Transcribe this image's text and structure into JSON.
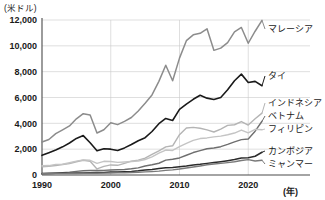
{
  "chart_data": {
    "type": "line",
    "title": "",
    "xlabel": "(年)",
    "ylabel": "(米ドル)",
    "unit_label": "(米ドル)",
    "year_label": "(年)",
    "grid": true,
    "legend_position": "right-inline",
    "xlim": [
      1990,
      2022
    ],
    "ylim": [
      0,
      12000
    ],
    "x_ticks": [
      "1990",
      "2000",
      "2010",
      "2020"
    ],
    "x_tick_values": [
      1990,
      2000,
      2010,
      2020
    ],
    "y_ticks": [
      "0",
      "2,000",
      "4,000",
      "6,000",
      "8,000",
      "10,000",
      "12,000"
    ],
    "y_tick_values": [
      0,
      2000,
      4000,
      6000,
      8000,
      10000,
      12000
    ],
    "x": [
      1990,
      1991,
      1992,
      1993,
      1994,
      1995,
      1996,
      1997,
      1998,
      1999,
      2000,
      2001,
      2002,
      2003,
      2004,
      2005,
      2006,
      2007,
      2008,
      2009,
      2010,
      2011,
      2012,
      2013,
      2014,
      2015,
      2016,
      2017,
      2018,
      2019,
      2020,
      2021,
      2022
    ],
    "series": [
      {
        "name": "マレーシア",
        "color": "#8c8c8c",
        "width": 1.5,
        "values": [
          2550,
          2750,
          3200,
          3500,
          3800,
          4350,
          4750,
          4650,
          3250,
          3500,
          4050,
          3900,
          4150,
          4450,
          4950,
          5550,
          6200,
          7250,
          8500,
          7300,
          9050,
          10400,
          10850,
          10970,
          11320,
          9650,
          9820,
          10250,
          11080,
          11420,
          10200,
          11130,
          11970
        ]
      },
      {
        "name": "タイ",
        "color": "#1a1a1a",
        "width": 1.6,
        "values": [
          1520,
          1720,
          1930,
          2180,
          2480,
          2830,
          3050,
          2500,
          1870,
          2030,
          2000,
          1900,
          2100,
          2360,
          2650,
          2890,
          3370,
          3970,
          4380,
          4220,
          5080,
          5490,
          5860,
          6170,
          5950,
          5840,
          6000,
          6600,
          7300,
          7810,
          7160,
          7250,
          6910
        ]
      },
      {
        "name": "インドネシア",
        "color": "#b4b4b4",
        "width": 1.4,
        "values": [
          640,
          680,
          730,
          810,
          890,
          1030,
          1140,
          1060,
          470,
          670,
          780,
          750,
          900,
          1070,
          1150,
          1300,
          1590,
          1860,
          2180,
          2260,
          3120,
          3640,
          3690,
          3620,
          3490,
          3330,
          3560,
          3840,
          3890,
          4140,
          3870,
          4350,
          4790
        ]
      },
      {
        "name": "ベトナム",
        "color": "#6e6e6e",
        "width": 1.4,
        "values": [
          95,
          140,
          145,
          185,
          225,
          280,
          325,
          350,
          350,
          360,
          390,
          405,
          430,
          480,
          550,
          700,
          790,
          910,
          1150,
          1220,
          1320,
          1530,
          1740,
          1890,
          2030,
          2090,
          2190,
          2370,
          2570,
          2740,
          2790,
          3390,
          4160
        ]
      },
      {
        "name": "フィリピン",
        "color": "#c4c4c4",
        "width": 1.4,
        "values": [
          720,
          730,
          820,
          830,
          950,
          1070,
          1170,
          1140,
          900,
          1060,
          1050,
          980,
          1010,
          1040,
          1080,
          1200,
          1400,
          1690,
          1930,
          1900,
          2200,
          2450,
          2680,
          2820,
          2870,
          2950,
          3010,
          3120,
          3250,
          3480,
          3260,
          3540,
          3500
        ]
      },
      {
        "name": "カンボジア",
        "color": "#2b2b2b",
        "width": 1.5,
        "values": [
          120,
          125,
          130,
          135,
          140,
          150,
          160,
          170,
          185,
          200,
          230,
          240,
          255,
          280,
          320,
          380,
          430,
          500,
          570,
          580,
          640,
          700,
          780,
          830,
          900,
          960,
          1030,
          1110,
          1200,
          1320,
          1340,
          1450,
          1760
        ]
      },
      {
        "name": "ミャンマー",
        "color": "#7a7a7a",
        "width": 1.4,
        "values": [
          100,
          102,
          105,
          110,
          115,
          120,
          125,
          130,
          135,
          145,
          155,
          165,
          180,
          195,
          215,
          240,
          265,
          300,
          360,
          400,
          460,
          540,
          620,
          700,
          790,
          850,
          900,
          960,
          1030,
          1120,
          1190,
          1080,
          1140
        ]
      }
    ],
    "legend_entries": [
      {
        "label": "マレーシア",
        "color": "#8c8c8c"
      },
      {
        "label": "タイ",
        "color": "#1a1a1a"
      },
      {
        "label": "インドネシア",
        "color": "#b4b4b4"
      },
      {
        "label": "ベトナム",
        "color": "#6e6e6e"
      },
      {
        "label": "フィリピン",
        "color": "#c4c4c4"
      },
      {
        "label": "カンボジア",
        "color": "#2b2b2b"
      },
      {
        "label": "ミャンマー",
        "color": "#7a7a7a"
      }
    ]
  }
}
